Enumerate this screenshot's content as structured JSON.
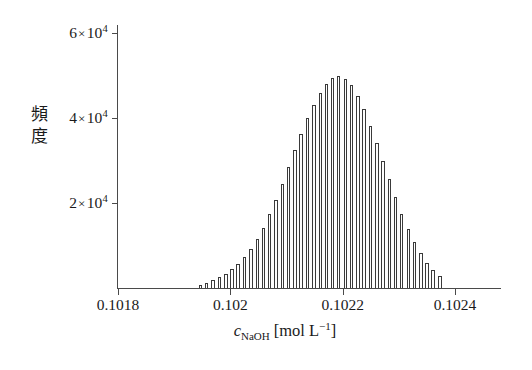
{
  "chart_data": {
    "type": "bar",
    "title": "",
    "subtitle": "",
    "xlabel": "c_NaOH [mol L^-1]",
    "ylabel": "頻度",
    "xlabel_parts": {
      "symbol": "c",
      "subscript": "NaOH",
      "unit_open": "[mol L",
      "unit_exponent": "−1",
      "unit_close": "]"
    },
    "ylabel_chars": [
      "頻",
      "度"
    ],
    "grid": false,
    "legend": null,
    "xlim": [
      0.1018,
      0.10248
    ],
    "ylim": [
      0,
      62000
    ],
    "x_ticks": [
      0.1018,
      0.102,
      0.1022,
      0.1024
    ],
    "x_tick_labels": [
      "0.1018",
      "0.102",
      "0.1022",
      "0.1024"
    ],
    "y_ticks": [
      20000,
      40000,
      60000
    ],
    "y_tick_labels": [
      "2 × 10⁴",
      "4 × 10⁴",
      "6 × 10⁴"
    ],
    "y_tick_label_parts": [
      {
        "coef": "2",
        "mul": "×",
        "base": "10",
        "exp": "4"
      },
      {
        "coef": "4",
        "mul": "×",
        "base": "10",
        "exp": "4"
      },
      {
        "coef": "6",
        "mul": "×",
        "base": "10",
        "exp": "4"
      }
    ],
    "bar_fill_color": "#ffffff",
    "bar_edge_color": "#3a3a3a",
    "axis_color": "#4a4a4a",
    "bin_width": 1.12e-05,
    "x": [
      0.101947,
      0.101958,
      0.101969,
      0.101981,
      0.101992,
      0.102003,
      0.102014,
      0.102025,
      0.102037,
      0.102048,
      0.102059,
      0.10207,
      0.102081,
      0.102093,
      0.102104,
      0.102115,
      0.102126,
      0.102137,
      0.102149,
      0.10216,
      0.102171,
      0.102182,
      0.102193,
      0.102205,
      0.102216,
      0.102227,
      0.102238,
      0.102249,
      0.102261,
      0.102272,
      0.102283,
      0.102294,
      0.102305,
      0.102317,
      0.102328,
      0.102339,
      0.10235,
      0.102361,
      0.102373
    ],
    "values": [
      800,
      1300,
      1900,
      2600,
      3400,
      4400,
      5700,
      7200,
      9200,
      11500,
      14200,
      17400,
      20800,
      24600,
      28600,
      32600,
      36400,
      40000,
      43200,
      46000,
      48100,
      49500,
      49900,
      49300,
      47800,
      45300,
      42100,
      38300,
      34200,
      29900,
      25600,
      21400,
      17500,
      14000,
      10900,
      8200,
      6000,
      4200,
      2900
    ],
    "bars": [
      {
        "x": 0.101947,
        "value": 800
      },
      {
        "x": 0.101958,
        "value": 1300
      },
      {
        "x": 0.101969,
        "value": 1900
      },
      {
        "x": 0.101981,
        "value": 2600
      },
      {
        "x": 0.101992,
        "value": 3400
      },
      {
        "x": 0.102003,
        "value": 4400
      },
      {
        "x": 0.102014,
        "value": 5700
      },
      {
        "x": 0.102025,
        "value": 7200
      },
      {
        "x": 0.102037,
        "value": 9200
      },
      {
        "x": 0.102048,
        "value": 11500
      },
      {
        "x": 0.102059,
        "value": 14200
      },
      {
        "x": 0.10207,
        "value": 17400
      },
      {
        "x": 0.102081,
        "value": 20800
      },
      {
        "x": 0.102093,
        "value": 24600
      },
      {
        "x": 0.102104,
        "value": 28600
      },
      {
        "x": 0.102115,
        "value": 32600
      },
      {
        "x": 0.102126,
        "value": 36400
      },
      {
        "x": 0.102137,
        "value": 40000
      },
      {
        "x": 0.102149,
        "value": 43200
      },
      {
        "x": 0.10216,
        "value": 46000
      },
      {
        "x": 0.102171,
        "value": 48100
      },
      {
        "x": 0.102182,
        "value": 49500
      },
      {
        "x": 0.102193,
        "value": 49900
      },
      {
        "x": 0.102205,
        "value": 49300
      },
      {
        "x": 0.102216,
        "value": 47800
      },
      {
        "x": 0.102227,
        "value": 45300
      },
      {
        "x": 0.102238,
        "value": 42100
      },
      {
        "x": 0.102249,
        "value": 38300
      },
      {
        "x": 0.102261,
        "value": 34200
      },
      {
        "x": 0.102272,
        "value": 29900
      },
      {
        "x": 0.102283,
        "value": 25600
      },
      {
        "x": 0.102294,
        "value": 21400
      },
      {
        "x": 0.102305,
        "value": 17500
      },
      {
        "x": 0.102317,
        "value": 14000
      },
      {
        "x": 0.102328,
        "value": 10900
      },
      {
        "x": 0.102339,
        "value": 8200
      },
      {
        "x": 0.10235,
        "value": 6000
      },
      {
        "x": 0.102361,
        "value": 4200
      },
      {
        "x": 0.102373,
        "value": 2900
      }
    ]
  }
}
